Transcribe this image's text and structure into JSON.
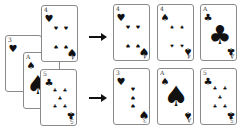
{
  "diagram": {
    "left_stack": [
      {
        "id": "c3",
        "rank": "3",
        "suit": "♥",
        "x": 5,
        "y": 35
      },
      {
        "id": "cA",
        "rank": "A",
        "suit": "♠",
        "x": 23,
        "y": 52
      },
      {
        "id": "c4",
        "rank": "4",
        "suit": "♥",
        "x": 41,
        "y": 5
      },
      {
        "id": "c5",
        "rank": "5",
        "suit": "♣",
        "x": 40,
        "y": 69
      }
    ],
    "arrows": [
      {
        "x": 89,
        "y": 37,
        "w": 13
      },
      {
        "x": 89,
        "y": 98,
        "w": 13
      }
    ],
    "top_row": [
      {
        "rank": "4",
        "suit": "♥"
      },
      {
        "rank": "4",
        "suit": "♠"
      },
      {
        "rank": "A",
        "suit": "♣"
      }
    ],
    "bottom_row": [
      {
        "rank": "3",
        "suit": "♥"
      },
      {
        "rank": "A",
        "suit": "♠"
      },
      {
        "rank": "5",
        "suit": "♣"
      }
    ]
  }
}
